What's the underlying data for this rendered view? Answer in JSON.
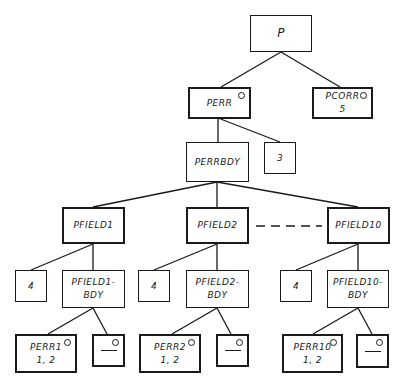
{
  "diagram": {
    "type": "tree",
    "nodes": {
      "p": {
        "label": "P",
        "sub": ""
      },
      "perr": {
        "label": "PERR",
        "sub": ""
      },
      "pcorr": {
        "label": "PCORR",
        "sub": "5"
      },
      "perrbdy": {
        "label": "PERRBDY",
        "sub": ""
      },
      "n3": {
        "label": "3",
        "sub": ""
      },
      "pfield1": {
        "label": "PFIELD1",
        "sub": ""
      },
      "pfield2": {
        "label": "PFIELD2",
        "sub": ""
      },
      "pfield10": {
        "label": "PFIELD10",
        "sub": ""
      },
      "n4a": {
        "label": "4",
        "sub": ""
      },
      "pfield1bdy": {
        "label": "PFIELD1-",
        "sub": "BDY"
      },
      "n4b": {
        "label": "4",
        "sub": ""
      },
      "pfield2bdy": {
        "label": "PFIELD2-",
        "sub": "BDY"
      },
      "n4c": {
        "label": "4",
        "sub": ""
      },
      "pfield10bdy": {
        "label": "PFIELD10-",
        "sub": "BDY"
      },
      "perr1": {
        "label": "PERR1",
        "sub": "1, 2"
      },
      "null1": {
        "label": "",
        "sub": ""
      },
      "perr2": {
        "label": "PERR2",
        "sub": "1, 2"
      },
      "null2": {
        "label": "",
        "sub": ""
      },
      "perr10": {
        "label": "PERR10",
        "sub": "1, 2"
      },
      "null3": {
        "label": "",
        "sub": ""
      }
    },
    "edges": [
      [
        "p",
        "perr"
      ],
      [
        "p",
        "pcorr"
      ],
      [
        "perr",
        "perrbdy"
      ],
      [
        "perr",
        "n3"
      ],
      [
        "perrbdy",
        "pfield1"
      ],
      [
        "perrbdy",
        "pfield2"
      ],
      [
        "perrbdy",
        "pfield10"
      ],
      [
        "pfield1",
        "n4a"
      ],
      [
        "pfield1",
        "pfield1bdy"
      ],
      [
        "pfield2",
        "n4b"
      ],
      [
        "pfield2",
        "pfield2bdy"
      ],
      [
        "pfield10",
        "n4c"
      ],
      [
        "pfield10",
        "pfield10bdy"
      ],
      [
        "pfield1bdy",
        "perr1"
      ],
      [
        "pfield1bdy",
        "null1"
      ],
      [
        "pfield2bdy",
        "perr2"
      ],
      [
        "pfield2bdy",
        "null2"
      ],
      [
        "pfield10bdy",
        "perr10"
      ],
      [
        "pfield10bdy",
        "null3"
      ]
    ],
    "ellipsis_edge": [
      "pfield2",
      "pfield10"
    ]
  }
}
